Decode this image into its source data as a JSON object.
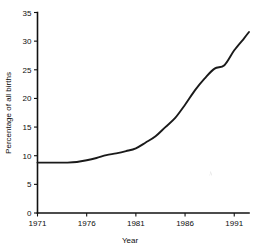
{
  "chart_data": {
    "type": "line",
    "title": "",
    "xlabel": "Year",
    "ylabel": "Percentage of all births",
    "xlim": [
      1971,
      1992.5
    ],
    "ylim": [
      0,
      35
    ],
    "grid": false,
    "legend": null,
    "xticks": [
      "1971",
      "1976",
      "1981",
      "1986",
      "1991"
    ],
    "xtick_values": [
      1971,
      1976,
      1981,
      1986,
      1991
    ],
    "yticks": [
      "0",
      "5",
      "10",
      "15",
      "20",
      "25",
      "30",
      "35"
    ],
    "ytick_values": [
      0,
      5,
      10,
      15,
      20,
      25,
      30,
      35
    ],
    "series": [
      {
        "name": "Percentage of all births",
        "x": [
          1971,
          1972,
          1973,
          1974,
          1975,
          1976,
          1977,
          1978,
          1979,
          1980,
          1981,
          1982,
          1983,
          1984,
          1985,
          1986,
          1987,
          1988,
          1989,
          1990,
          1991,
          1992,
          1992.5
        ],
        "values": [
          8.8,
          8.8,
          8.8,
          8.8,
          8.9,
          9.2,
          9.6,
          10.1,
          10.4,
          10.8,
          11.3,
          12.3,
          13.4,
          15.0,
          16.6,
          18.9,
          21.4,
          23.5,
          25.2,
          25.8,
          28.4,
          30.5,
          31.6
        ]
      }
    ]
  },
  "artifacts": {
    "speck_label": "scan-speck"
  }
}
